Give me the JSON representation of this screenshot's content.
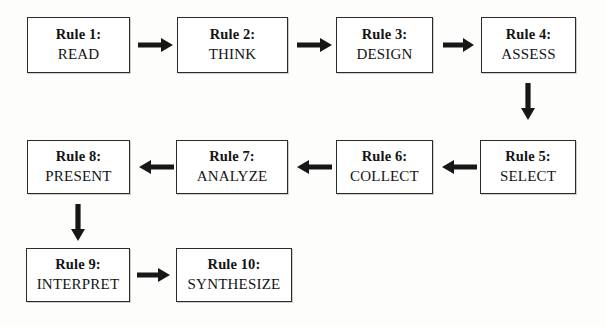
{
  "diagram": {
    "type": "flowchart",
    "direction": "boustrophedon",
    "colors": {
      "background": "#fdfdfc",
      "box_fill": "#ffffff",
      "box_border": "#2b2b2b",
      "text": "#141414",
      "arrow": "#171717"
    },
    "nodes": [
      {
        "id": "rule1",
        "label": "Rule 1:",
        "action": "READ",
        "row": 1,
        "col": 1
      },
      {
        "id": "rule2",
        "label": "Rule 2:",
        "action": "THINK",
        "row": 1,
        "col": 2
      },
      {
        "id": "rule3",
        "label": "Rule 3:",
        "action": "DESIGN",
        "row": 1,
        "col": 3
      },
      {
        "id": "rule4",
        "label": "Rule 4:",
        "action": "ASSESS",
        "row": 1,
        "col": 4
      },
      {
        "id": "rule5",
        "label": "Rule 5:",
        "action": "SELECT",
        "row": 2,
        "col": 4
      },
      {
        "id": "rule6",
        "label": "Rule 6:",
        "action": "COLLECT",
        "row": 2,
        "col": 3
      },
      {
        "id": "rule7",
        "label": "Rule 7:",
        "action": "ANALYZE",
        "row": 2,
        "col": 2
      },
      {
        "id": "rule8",
        "label": "Rule 8:",
        "action": "PRESENT",
        "row": 2,
        "col": 1
      },
      {
        "id": "rule9",
        "label": "Rule 9:",
        "action": "INTERPRET",
        "row": 3,
        "col": 1
      },
      {
        "id": "rule10",
        "label": "Rule 10:",
        "action": "SYNTHESIZE",
        "row": 3,
        "col": 2
      }
    ],
    "edges": [
      {
        "from": "rule1",
        "to": "rule2",
        "direction": "right"
      },
      {
        "from": "rule2",
        "to": "rule3",
        "direction": "right"
      },
      {
        "from": "rule3",
        "to": "rule4",
        "direction": "right"
      },
      {
        "from": "rule4",
        "to": "rule5",
        "direction": "down"
      },
      {
        "from": "rule5",
        "to": "rule6",
        "direction": "left"
      },
      {
        "from": "rule6",
        "to": "rule7",
        "direction": "left"
      },
      {
        "from": "rule7",
        "to": "rule8",
        "direction": "left"
      },
      {
        "from": "rule8",
        "to": "rule9",
        "direction": "down"
      },
      {
        "from": "rule9",
        "to": "rule10",
        "direction": "right"
      }
    ]
  }
}
